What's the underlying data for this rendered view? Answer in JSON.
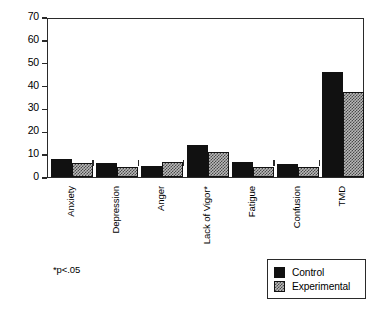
{
  "chart_data": {
    "type": "bar",
    "title": "",
    "xlabel": "",
    "ylabel": "",
    "ylim": [
      0,
      70
    ],
    "yticks": [
      0,
      10,
      20,
      30,
      40,
      50,
      60,
      70
    ],
    "grid": false,
    "legend_position": "bottom-right",
    "categories": [
      "Anxiety",
      "Depression",
      "Anger",
      "Lack of Vigor*",
      "Fatigue",
      "Confusion",
      "TMD"
    ],
    "series": [
      {
        "name": "Control",
        "color": "#111111",
        "values": [
          8,
          6,
          5,
          14,
          6.5,
          5.5,
          46
        ]
      },
      {
        "name": "Experimental",
        "color": "#b9b9b9",
        "values": [
          6,
          4.5,
          6.5,
          11,
          4.5,
          4.5,
          37
        ]
      }
    ],
    "annotations": [
      "*p<.05"
    ]
  },
  "axis": {
    "y_tick_labels": [
      "70",
      "60",
      "50",
      "40",
      "30",
      "20",
      "10",
      "0"
    ]
  },
  "legend": {
    "entries": [
      {
        "label": "Control"
      },
      {
        "label": "Experimental"
      }
    ]
  },
  "footnote": {
    "text": "*p<.05"
  }
}
